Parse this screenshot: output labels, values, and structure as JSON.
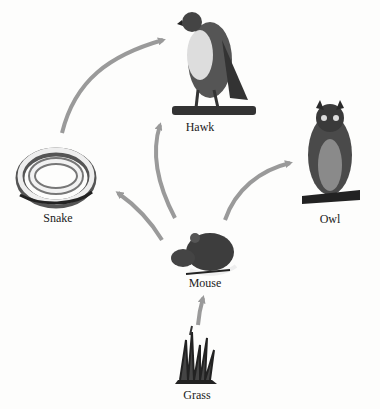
{
  "diagram": {
    "type": "food-web",
    "arrow_color": "#9a9a9a",
    "organisms": [
      {
        "id": "hawk",
        "label": "Hawk",
        "x": 200,
        "y": 127
      },
      {
        "id": "owl",
        "label": "Owl",
        "x": 330,
        "y": 220
      },
      {
        "id": "snake",
        "label": "Snake",
        "x": 58,
        "y": 219
      },
      {
        "id": "mouse",
        "label": "Mouse",
        "x": 203,
        "y": 283
      },
      {
        "id": "grass",
        "label": "Grass",
        "x": 196,
        "y": 395
      }
    ],
    "edges": [
      {
        "from": "Grass",
        "to": "Mouse"
      },
      {
        "from": "Mouse",
        "to": "Snake"
      },
      {
        "from": "Mouse",
        "to": "Hawk"
      },
      {
        "from": "Mouse",
        "to": "Owl"
      },
      {
        "from": "Snake",
        "to": "Hawk"
      }
    ]
  }
}
